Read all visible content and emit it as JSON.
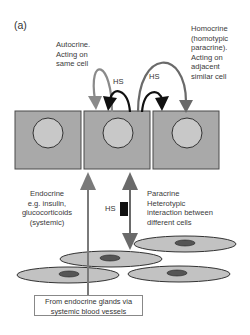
{
  "panel": {
    "label": "(a)"
  },
  "labels": {
    "autocrine": [
      "Autocrine.",
      "Acting on",
      "same cell"
    ],
    "homocrine": [
      "Homocrine",
      "(homotypic",
      "paracrine).",
      "Acting on",
      "adjacent",
      "similar  cell"
    ],
    "endocrine": [
      "Endocrine",
      "e.g. insulin,",
      "glucocorticoids",
      "(systemic)"
    ],
    "paracrine": [
      "Paracrine",
      "Heterotypic",
      "interaction between",
      "different cells"
    ],
    "hs_autocrine": "HS",
    "hs_homocrine": "HS",
    "hs_paracrine": "HS",
    "source_box": [
      "From endocrine glands via",
      "systemic blood vessels"
    ]
  },
  "colors": {
    "cell_fill": "#a9a9a9",
    "cell_border": "#4a4a4a",
    "nucleus_fill": "#c8c8c8",
    "ellipse_fill": "#c2c2c2",
    "ellipse_nucleus": "#555555",
    "arrow_gray": "#8a8a8a",
    "arrow_dark_gray": "#6a6a6a",
    "arrow_black": "#111111"
  }
}
